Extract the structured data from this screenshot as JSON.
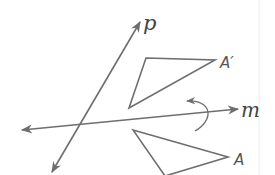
{
  "diagram": {
    "type": "geometry-transformation",
    "colors": {
      "stroke": "#6e6e6e",
      "label": "#444444",
      "background": "#ffffff",
      "edge": "#e6e6e6"
    },
    "lines": [
      {
        "id": "p",
        "label": "p",
        "from": [
          52,
          172
        ],
        "to": [
          140,
          22
        ],
        "arrows": "both"
      },
      {
        "id": "m",
        "label": "m",
        "from": [
          22,
          130
        ],
        "to": [
          238,
          109
        ],
        "arrows": "both"
      }
    ],
    "triangles": [
      {
        "id": "A_prime",
        "label": "A′",
        "vertices": [
          [
            146,
            58
          ],
          [
            215,
            60
          ],
          [
            129,
            108
          ]
        ]
      },
      {
        "id": "A",
        "label": "A",
        "vertices": [
          [
            133,
            130
          ],
          [
            228,
            157
          ],
          [
            165,
            175
          ]
        ]
      }
    ],
    "rotation_arrow": {
      "direction": "counterclockwise",
      "near_line": "m"
    }
  },
  "labels": {
    "p": "p",
    "m": "m",
    "a_prime": "A′",
    "a": "A"
  }
}
